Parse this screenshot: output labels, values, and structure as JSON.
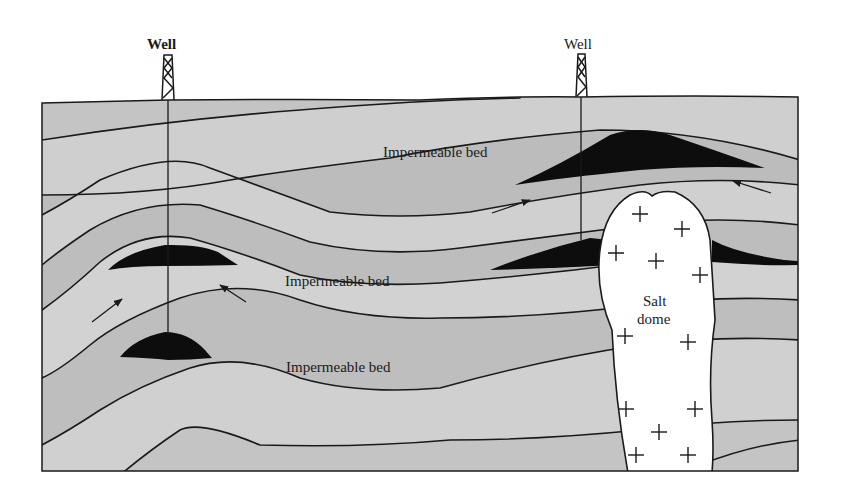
{
  "diagram": {
    "type": "geologic-cross-section",
    "wells": [
      {
        "label": "Well",
        "x": 168
      },
      {
        "label": "Well",
        "x": 581
      }
    ],
    "labels": {
      "bed_top": "Impermeable bed",
      "bed_middle": "Impermeable bed",
      "bed_bottom": "Impermeable bed",
      "salt_dome_line1": "Salt",
      "salt_dome_line2": "dome"
    },
    "traps": [
      {
        "name": "anticline-trap-upper",
        "description": "Oil accumulation at anticline crest"
      },
      {
        "name": "anticline-trap-lower",
        "description": "Oil accumulation at lower anticline crest"
      },
      {
        "name": "salt-dome-trap-upper",
        "description": "Oil accumulation above salt dome"
      },
      {
        "name": "salt-dome-trap-flank",
        "description": "Oil accumulation against salt dome flank"
      }
    ],
    "arrows": [
      {
        "name": "migration-arrow-left-up",
        "direction": "up-right"
      },
      {
        "name": "migration-arrow-left-down",
        "direction": "up-left"
      },
      {
        "name": "migration-arrow-right-left",
        "direction": "up-right"
      },
      {
        "name": "migration-arrow-right-right",
        "direction": "up-left"
      }
    ],
    "colors": {
      "strata_light": "#c9c9c9",
      "strata_dark": "#b4b4b4",
      "oil": "#0d0d0d",
      "salt": "#ffffff",
      "line": "#1a1a1a"
    }
  }
}
